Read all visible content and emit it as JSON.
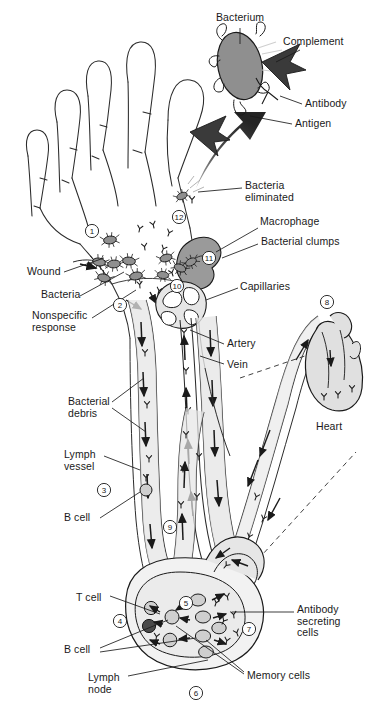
{
  "figure": {
    "width": 374,
    "height": 709
  },
  "colors": {
    "ink": "#1a1a1a",
    "line": "#2b2b2b",
    "bacterium_fill": "#8f8f8f",
    "cell_fill": "#cfcfcf",
    "vessel_fill": "#e6e6e6",
    "artery_fill": "#d6d6d6",
    "node_fill": "#f0f0f0",
    "arrow_dark": "#3a3a3a",
    "macrophage_fill": "#9a9a9a",
    "background": "#ffffff"
  },
  "inset": {
    "name": "bacterium-opsonization-detail",
    "labels": {
      "bacterium": "Bacterium",
      "complement": "Complement",
      "antibody": "Antibody",
      "antigen": "Antigen"
    }
  },
  "labels": {
    "bacteria_eliminated": "Bacteria\neliminated",
    "macrophage": "Macrophage",
    "bacterial_clumps": "Bacterial clumps",
    "capillaries": "Capillaries",
    "artery": "Artery",
    "vein": "Vein",
    "heart": "Heart",
    "wound": "Wound",
    "bacteria": "Bacteria",
    "nonspecific_response": "Nonspecific\nresponse",
    "bacterial_debris": "Bacterial\ndebris",
    "lymph_vessel": "Lymph\nvessel",
    "b_cell_upper": "B cell",
    "t_cell": "T cell",
    "b_cell_lower": "B cell",
    "lymph_node": "Lymph\nnode",
    "antibody_secreting_cells": "Antibody\nsecreting\ncells",
    "memory_cells": "Memory cells"
  },
  "step_markers": [
    {
      "id": 1,
      "label": "1",
      "x": 92,
      "y": 231
    },
    {
      "id": 2,
      "label": "2",
      "x": 120,
      "y": 305
    },
    {
      "id": 3,
      "label": "3",
      "x": 104,
      "y": 490
    },
    {
      "id": 4,
      "label": "4",
      "x": 120,
      "y": 621
    },
    {
      "id": 5,
      "label": "5",
      "x": 186,
      "y": 603
    },
    {
      "id": 6,
      "label": "6",
      "x": 196,
      "y": 693
    },
    {
      "id": 7,
      "label": "7",
      "x": 249,
      "y": 629
    },
    {
      "id": 8,
      "label": "8",
      "x": 327,
      "y": 302
    },
    {
      "id": 9,
      "label": "9",
      "x": 170,
      "y": 527
    },
    {
      "id": 10,
      "label": "10",
      "x": 177,
      "y": 286
    },
    {
      "id": 11,
      "label": "11",
      "x": 209,
      "y": 258
    },
    {
      "id": 12,
      "label": "12",
      "x": 179,
      "y": 217
    }
  ],
  "label_positions": {
    "bacterium": {
      "x": 216,
      "y": 12,
      "w": 80
    },
    "complement": {
      "x": 283,
      "y": 36,
      "w": 88
    },
    "antibody": {
      "x": 305,
      "y": 98,
      "w": 66
    },
    "antigen": {
      "x": 295,
      "y": 118,
      "w": 62
    },
    "bacteria_eliminated": {
      "x": 245,
      "y": 180,
      "w": 90
    },
    "macrophage": {
      "x": 260,
      "y": 221,
      "w": 86
    },
    "bacterial_clumps": {
      "x": 261,
      "y": 238,
      "w": 104
    },
    "capillaries": {
      "x": 240,
      "y": 281,
      "w": 76
    },
    "artery": {
      "x": 227,
      "y": 338,
      "w": 50
    },
    "vein": {
      "x": 227,
      "y": 359,
      "w": 42
    },
    "heart": {
      "x": 316,
      "y": 421,
      "w": 46
    },
    "wound": {
      "x": 27,
      "y": 266,
      "w": 52
    },
    "bacteria": {
      "x": 41,
      "y": 289,
      "w": 56
    },
    "nonspecific_response": {
      "x": 32,
      "y": 310,
      "w": 76
    },
    "bacterial_debris": {
      "x": 68,
      "y": 396,
      "w": 60
    },
    "lymph_vessel": {
      "x": 64,
      "y": 449,
      "w": 52
    },
    "b_cell_upper": {
      "x": 64,
      "y": 512,
      "w": 48
    },
    "t_cell": {
      "x": 76,
      "y": 592,
      "w": 46
    },
    "b_cell_lower": {
      "x": 64,
      "y": 644,
      "w": 48
    },
    "lymph_node": {
      "x": 88,
      "y": 672,
      "w": 52
    },
    "antibody_secreting": {
      "x": 297,
      "y": 604,
      "w": 74
    },
    "memory_cells": {
      "x": 247,
      "y": 670,
      "w": 90
    }
  }
}
